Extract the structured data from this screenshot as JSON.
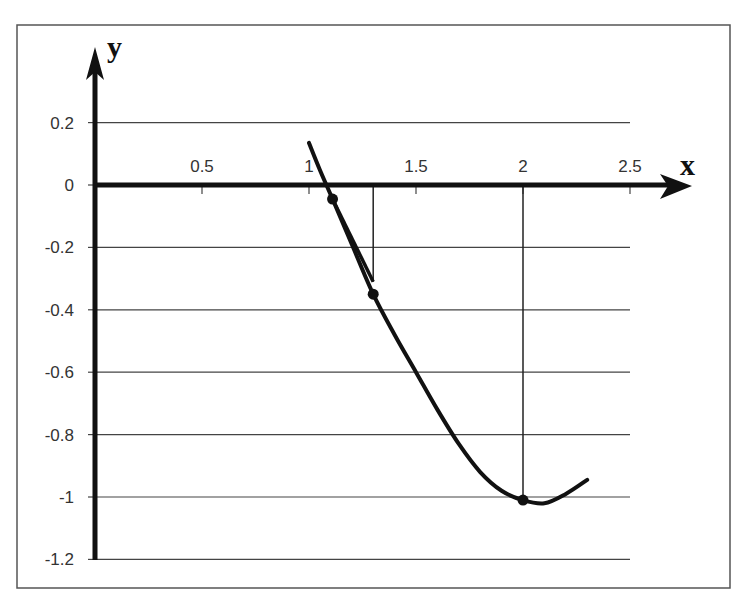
{
  "chart_data": {
    "type": "line",
    "title": "",
    "xlabel": "x",
    "ylabel": "y",
    "xlim": [
      0,
      2.7
    ],
    "ylim": [
      -1.2,
      0.35
    ],
    "grid": "horizontal",
    "legend": null,
    "x_ticks": [
      0.5,
      1,
      1.5,
      2,
      2.5
    ],
    "x_tick_labels": [
      "0.5",
      "1",
      "1.5",
      "2",
      "2.5"
    ],
    "y_ticks": [
      0.2,
      0,
      -0.2,
      -0.4,
      -0.6,
      -0.8,
      -1,
      -1.2
    ],
    "y_tick_labels": [
      "0.2",
      "0",
      "-0.2",
      "-0.4",
      "-0.6",
      "-0.8",
      "-1",
      "-1.2"
    ],
    "series": [
      {
        "name": "curve",
        "x": [
          1.0,
          1.05,
          1.11,
          1.2,
          1.3,
          1.4,
          1.5,
          1.6,
          1.7,
          1.8,
          1.9,
          2.0,
          2.1,
          2.2,
          2.3
        ],
        "y": [
          0.135,
          0.05,
          -0.045,
          -0.19,
          -0.35,
          -0.48,
          -0.6,
          -0.72,
          -0.83,
          -0.92,
          -0.98,
          -1.01,
          -1.02,
          -0.99,
          -0.945
        ]
      }
    ],
    "marked_points": [
      {
        "x": 1.11,
        "y": -0.045
      },
      {
        "x": 1.3,
        "y": -0.35
      },
      {
        "x": 2.0,
        "y": -1.01
      }
    ],
    "construction_lines": [
      {
        "type": "vertical",
        "x": 1.3,
        "y_from": 0,
        "y_to": -0.31
      },
      {
        "type": "segment",
        "from": [
          1.11,
          -0.045
        ],
        "to": [
          1.3,
          -0.31
        ]
      },
      {
        "type": "vertical",
        "x": 2.0,
        "y_from": 0,
        "y_to": -1.01
      }
    ]
  },
  "labels": {
    "x_axis": "x",
    "y_axis": "y"
  }
}
